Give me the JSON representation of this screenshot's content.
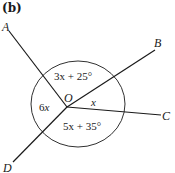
{
  "figure": {
    "label": "(b)",
    "center_point": "O",
    "points": {
      "A": "A",
      "B": "B",
      "C": "C",
      "D": "D"
    },
    "angles": {
      "AOB": {
        "var": "3x",
        "rest": " + 25°"
      },
      "AOD": {
        "var": "6",
        "italic": "x"
      },
      "BOC": {
        "italic": "x"
      },
      "COD": {
        "var": "5x",
        "rest": " + 35°"
      }
    },
    "colors": {
      "stroke": "#1a1a1a",
      "background": "#ffffff"
    }
  }
}
